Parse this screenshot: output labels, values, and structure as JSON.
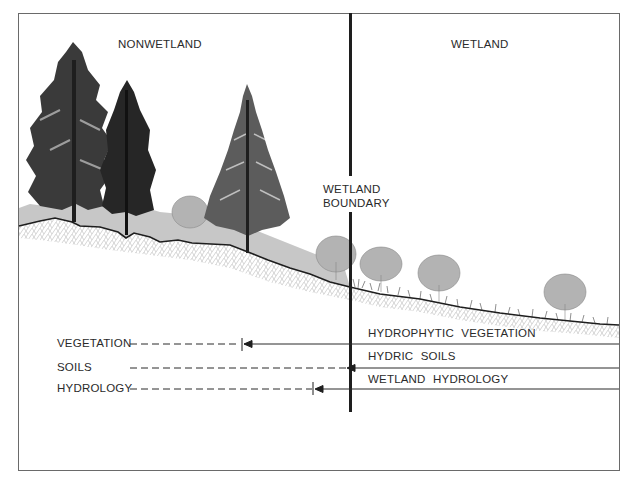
{
  "regions": {
    "left": "NONWETLAND",
    "right": "WETLAND"
  },
  "boundary": {
    "line1": "WETLAND",
    "line2": "BOUNDARY"
  },
  "left_criteria": [
    {
      "label": "VEGETATION",
      "extent": "stops before boundary (tick)"
    },
    {
      "label": "SOILS",
      "extent": "reaches boundary"
    },
    {
      "label": "HYDROLOGY",
      "extent": "stops before boundary (tick)"
    }
  ],
  "right_criteria": [
    {
      "label": "HYDROPHYTIC  VEGETATION"
    },
    {
      "label": "HYDRIC  SOILS"
    },
    {
      "label": "WETLAND  HYDROLOGY"
    }
  ],
  "colors": {
    "line": "#1e1e1e",
    "frame": "#6a6a6a",
    "soil_hatch": "#c8c8c8",
    "grass": "#a8a8a8",
    "shrub": "#9a9a9a",
    "tree_dark": "#2a2a2a"
  },
  "icons": {
    "tree": "pine-tree-icon",
    "shrub": "shrub-icon",
    "arrow": "arrowhead-left-icon"
  }
}
